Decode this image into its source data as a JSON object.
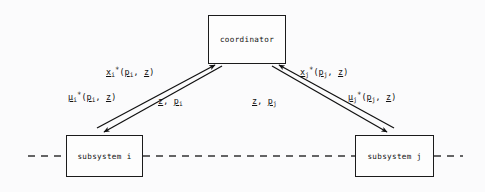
{
  "diagram": {
    "background_color": "#fbfbfc",
    "stroke_color": "#1b1b1b",
    "nodes": [
      {
        "id": "coordinator",
        "label": "coordinator",
        "shape": "rectangle"
      },
      {
        "id": "subsystem_i",
        "label": "subsystem i",
        "shape": "rectangle"
      },
      {
        "id": "subsystem_j",
        "label": "subsystem j",
        "shape": "rectangle"
      }
    ],
    "edge_labels": {
      "x_i": {
        "base": "x",
        "sub": "i",
        "sup": "*",
        "open": "(",
        "arg1": "p",
        "arg1_sub": "i",
        "comma": ", ",
        "arg2": "z",
        "close": ")",
        "plain": "x_i*(p_i, z)"
      },
      "mu_i": {
        "base": "μ",
        "sub": "i",
        "sup": "*",
        "open": "(",
        "arg1": "p",
        "arg1_sub": "i",
        "comma": ", ",
        "arg2": "z",
        "close": ")",
        "plain": "μ_i*(p_i, z)"
      },
      "zp_i": {
        "arg1": "z",
        "comma": ", ",
        "arg2": "p",
        "arg2_sub": "i",
        "plain": "z, p_i"
      },
      "x_j": {
        "base": "x",
        "sub": "j",
        "sup": "*",
        "open": "(",
        "arg1": "p",
        "arg1_sub": "j",
        "comma": ", ",
        "arg2": "z",
        "close": ")",
        "plain": "x_j*(p_j, z)"
      },
      "mu_j": {
        "base": "μ",
        "sub": "j",
        "sup": "*",
        "open": "(",
        "arg1": "p",
        "arg1_sub": "j",
        "comma": ", ",
        "arg2": "z",
        "close": ")",
        "plain": "μ_j*(p_j, z)"
      },
      "zp_j": {
        "arg1": "z",
        "comma": ", ",
        "arg2": "p",
        "arg2_sub": "j",
        "plain": "z, p_j"
      }
    },
    "edges": [
      {
        "id": "edge-i-up",
        "from": "subsystem_i",
        "to": "coordinator",
        "label": "x_i",
        "arrow": "to"
      },
      {
        "id": "edge-i-down",
        "from": "coordinator",
        "to": "subsystem_i",
        "label": "mu_i",
        "arrow": "to"
      },
      {
        "id": "edge-j-up",
        "from": "subsystem_j",
        "to": "coordinator",
        "label": "x_j",
        "arrow": "to"
      },
      {
        "id": "edge-j-down",
        "from": "coordinator",
        "to": "subsystem_j",
        "label": "mu_j",
        "arrow": "to"
      }
    ],
    "horizontal_dashed_line": {
      "style": "dashed",
      "y": 156
    }
  }
}
